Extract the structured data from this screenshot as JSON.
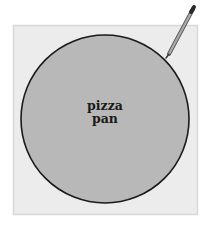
{
  "diagram": {
    "label_line1": "pizza",
    "label_line2": "pan",
    "colors": {
      "background": "#ffffff",
      "square_fill": "#ececec",
      "square_border": "#d8d8d8",
      "circle_fill": "#b8b8b8",
      "circle_stroke": "#1a1a1a",
      "pencil": "#8a8a8a"
    }
  }
}
